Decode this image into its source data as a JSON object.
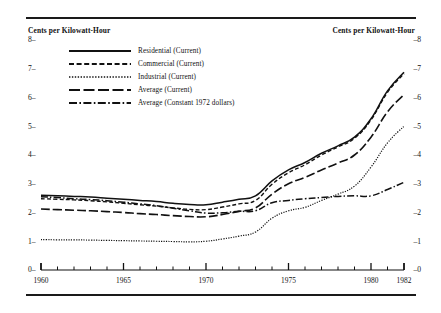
{
  "axis_caption_left": "Cents per Kilowatt-Hour",
  "axis_caption_right": "Cents per Kilowatt-Hour",
  "legend": {
    "items": [
      {
        "label": "Residential (Current)",
        "key": "solid-line-key"
      },
      {
        "label": "Commercial (Current)",
        "key": "dashed-line-key"
      },
      {
        "label": "Industrial (Current)",
        "key": "dotted-line-key"
      },
      {
        "label": "Average (Current)",
        "key": "long-dash-line-key"
      },
      {
        "label": "Average (Constant 1972 dollars)",
        "key": "dash-dot-line-key"
      }
    ]
  },
  "chart_data": {
    "type": "line",
    "title": "",
    "xlabel": "",
    "ylabel": "Cents per Kilowatt-Hour",
    "ylabel_right": "Cents per Kilowatt-Hour",
    "xlim": [
      1960,
      1982
    ],
    "ylim": [
      0,
      8
    ],
    "grid": false,
    "legend_position": "upper-left",
    "ytick_labels": [
      "0",
      "1",
      "2",
      "3",
      "4",
      "5",
      "6",
      "7",
      "8"
    ],
    "ytick_values": [
      0,
      1,
      2,
      3,
      4,
      5,
      6,
      7,
      8
    ],
    "xtick_labels": [
      "1960",
      "1965",
      "1970",
      "1975",
      "1980",
      "1982"
    ],
    "xtick_values": [
      1960,
      1965,
      1970,
      1975,
      1980,
      1982
    ],
    "xminor_tick_step": 1,
    "x": [
      1960,
      1961,
      1962,
      1963,
      1964,
      1965,
      1966,
      1967,
      1968,
      1969,
      1970,
      1971,
      1972,
      1973,
      1974,
      1975,
      1976,
      1977,
      1978,
      1979,
      1980,
      1981,
      1982
    ],
    "series": [
      {
        "name": "Residential (Current)",
        "style": "solid",
        "values": [
          2.6,
          2.58,
          2.56,
          2.54,
          2.5,
          2.46,
          2.42,
          2.38,
          2.32,
          2.28,
          2.27,
          2.36,
          2.46,
          2.58,
          3.1,
          3.48,
          3.74,
          4.06,
          4.32,
          4.62,
          5.26,
          6.23,
          6.88
        ]
      },
      {
        "name": "Commercial (Current)",
        "style": "dashed",
        "values": [
          2.48,
          2.46,
          2.44,
          2.41,
          2.37,
          2.32,
          2.27,
          2.22,
          2.16,
          2.11,
          2.1,
          2.19,
          2.3,
          2.42,
          2.98,
          3.38,
          3.66,
          4.0,
          4.28,
          4.58,
          5.22,
          6.18,
          6.83
        ]
      },
      {
        "name": "Industrial (Current)",
        "style": "dotted",
        "values": [
          1.06,
          1.05,
          1.05,
          1.04,
          1.03,
          1.02,
          1.01,
          1.0,
          0.99,
          0.98,
          1.0,
          1.08,
          1.18,
          1.32,
          1.8,
          2.06,
          2.18,
          2.42,
          2.64,
          2.92,
          3.58,
          4.42,
          5.0
        ]
      },
      {
        "name": "Average (Current)",
        "style": "long-dash",
        "values": [
          2.12,
          2.1,
          2.08,
          2.06,
          2.03,
          2.0,
          1.96,
          1.93,
          1.89,
          1.86,
          1.85,
          1.93,
          2.04,
          2.16,
          2.64,
          3.0,
          3.22,
          3.48,
          3.72,
          4.0,
          4.62,
          5.5,
          6.1
        ]
      },
      {
        "name": "Average (Constant 1972 dollars)",
        "style": "dash-dot",
        "values": [
          2.55,
          2.52,
          2.48,
          2.45,
          2.41,
          2.36,
          2.3,
          2.24,
          2.15,
          2.06,
          1.98,
          1.99,
          2.04,
          2.06,
          2.34,
          2.42,
          2.48,
          2.52,
          2.56,
          2.58,
          2.58,
          2.8,
          3.05
        ]
      }
    ]
  }
}
